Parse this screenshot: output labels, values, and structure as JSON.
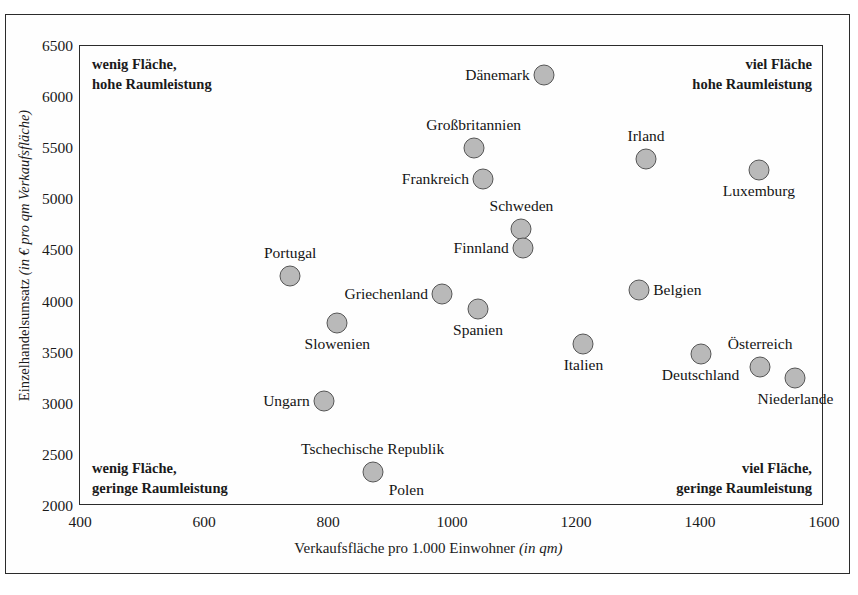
{
  "chart_data": {
    "type": "scatter",
    "title": "",
    "xlabel": "Verkaufsfläche pro 1.000 Einwohner (in qm)",
    "xlabel_main": "Verkaufsfläche pro 1.000 Einwohner ",
    "xlabel_italic": "(in qm)",
    "ylabel": "Einzelhandelsumsatz (in € pro qm Verkaufsfläche)",
    "ylabel_main": "Einzelhandelsumsatz ",
    "ylabel_italic": "(in € pro qm Verkaufsfläche)",
    "xlim": [
      400,
      1600
    ],
    "ylim": [
      2000,
      6500
    ],
    "xticks": [
      "400",
      "600",
      "800",
      "1000",
      "1200",
      "1400",
      "1600"
    ],
    "yticks": [
      "2000",
      "2500",
      "3000",
      "3500",
      "4000",
      "4500",
      "5000",
      "5500",
      "6000",
      "6500"
    ],
    "grid": false,
    "legend": "none",
    "marker_color": "#b9b9b9",
    "marker_edge_color": "#555555",
    "points": [
      {
        "label": "Dänemark",
        "x": 1148,
        "y": 6220,
        "lblpos": "l"
      },
      {
        "label": "Großbritannien",
        "x": 1035,
        "y": 5500,
        "lblpos": "t"
      },
      {
        "label": "Frankreich",
        "x": 1050,
        "y": 5200,
        "lblpos": "l"
      },
      {
        "label": "Irland",
        "x": 1313,
        "y": 5390,
        "lblpos": "t"
      },
      {
        "label": "Luxemburg",
        "x": 1495,
        "y": 5290,
        "lblpos": "b"
      },
      {
        "label": "Schweden",
        "x": 1112,
        "y": 4710,
        "lblpos": "t"
      },
      {
        "label": "Finnland",
        "x": 1114,
        "y": 4520,
        "lblpos": "l"
      },
      {
        "label": "Portugal",
        "x": 739,
        "y": 4250,
        "lblpos": "t"
      },
      {
        "label": "Griechenland",
        "x": 984,
        "y": 4070,
        "lblpos": "l"
      },
      {
        "label": "Belgien",
        "x": 1302,
        "y": 4110,
        "lblpos": "r"
      },
      {
        "label": "Spanien",
        "x": 1042,
        "y": 3930,
        "lblpos": "b"
      },
      {
        "label": "Slowenien",
        "x": 815,
        "y": 3790,
        "lblpos": "b"
      },
      {
        "label": "Italien",
        "x": 1212,
        "y": 3580,
        "lblpos": "b"
      },
      {
        "label": "Deutschland",
        "x": 1401,
        "y": 3490,
        "lblpos": "b"
      },
      {
        "label": "Österreich",
        "x": 1497,
        "y": 3360,
        "lblpos": "t"
      },
      {
        "label": "Niederlande",
        "x": 1554,
        "y": 3250,
        "lblpos": "b"
      },
      {
        "label": "Ungarn",
        "x": 793,
        "y": 3030,
        "lblpos": "l"
      },
      {
        "label": "Tschechische Republik",
        "x": 872,
        "y": 2330,
        "lblpos": "t"
      },
      {
        "label": "Polen",
        "x": 872,
        "y": 2330,
        "lblpos": "br"
      }
    ]
  },
  "quadrants": {
    "top_left_line1": "wenig Fläche,",
    "top_left_line2": "hohe Raumleistung",
    "top_right_line1": "viel Fläche",
    "top_right_line2": "hohe Raumleistung",
    "bottom_left_line1": "wenig Fläche,",
    "bottom_left_line2": "geringe Raumleistung",
    "bottom_right_line1": "viel Fläche,",
    "bottom_right_line2": "geringe Raumleistung"
  }
}
